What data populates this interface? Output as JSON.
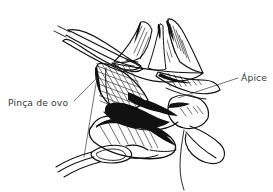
{
  "figure": {
    "type": "anatomical-line-drawing",
    "language": "pt-BR",
    "background_color": "#ffffff",
    "ink_color": "#111111",
    "label_color": "#3a3a3a",
    "width": 273,
    "height": 192
  },
  "labels": [
    {
      "id": "forceps",
      "text": "Pinça de ovo",
      "x": 8,
      "y": 106,
      "anchor": "start",
      "leader": "M 74 101 L 97 78 M 97 78 L 84 157"
    },
    {
      "id": "apex",
      "text": "Ápice",
      "x": 241,
      "y": 81,
      "anchor": "start",
      "leader": "M 238 78 L 178 98"
    }
  ],
  "annotations": {
    "forceps_label": "Pinça de ovo",
    "apex_label": "Ápice"
  }
}
